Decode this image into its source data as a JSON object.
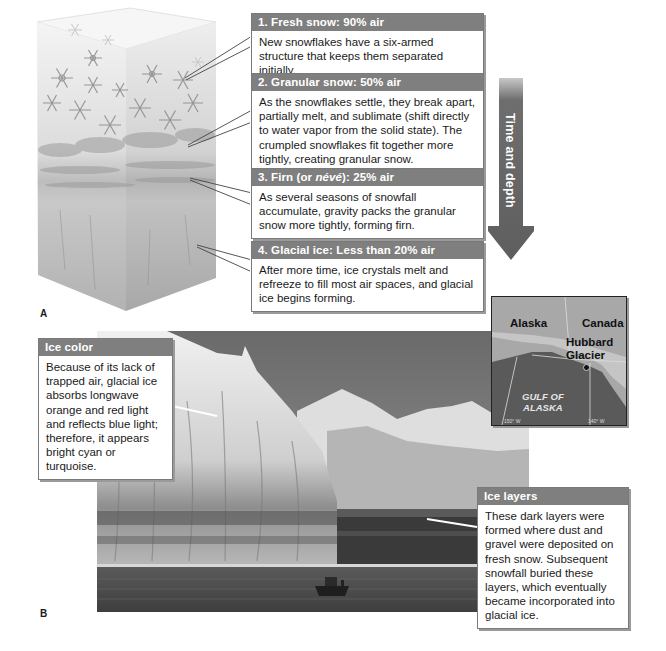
{
  "part_a": {
    "panel_label": "A",
    "stages": [
      {
        "title_prefix": "1. Fresh snow: 90% air",
        "title_italic": "",
        "title_suffix": "",
        "text": "New snowflakes have a six-armed structure that keeps them separated initially."
      },
      {
        "title_prefix": "2. Granular snow: 50% air",
        "title_italic": "",
        "title_suffix": "",
        "text": "As the snowflakes settle, they break apart, partially melt, and sublimate (shift directly to water vapor from the solid state). The crumpled snowflakes fit together more tightly, creating granular snow."
      },
      {
        "title_prefix": "3. Firn (or ",
        "title_italic": "névé",
        "title_suffix": "): 25% air",
        "text": "As several seasons of snowfall accumulate, gravity packs the granular snow more tightly, forming firn."
      },
      {
        "title_prefix": "4. Glacial ice: Less than 20% air",
        "title_italic": "",
        "title_suffix": "",
        "text": "After more time, ice crystals melt and refreeze to fill most air spaces, and glacial ice begins forming."
      }
    ],
    "arrow_label": "Time and depth"
  },
  "part_b": {
    "panel_label": "B",
    "ice_color": {
      "title": "Ice color",
      "text": "Because of its lack of trapped air, glacial ice absorbs longwave orange and red light and reflects blue light; therefore, it appears bright cyan or turquoise."
    },
    "ice_layers": {
      "title": "Ice layers",
      "text": "These dark layers were formed where dust and gravel were deposited on fresh snow. Subsequent snowfall buried these layers, which eventually became incorporated into glacial ice."
    },
    "map": {
      "labels": {
        "alaska": "Alaska",
        "canada": "Canada",
        "glacier_line1": "Hubbard",
        "glacier_line2": "Glacier",
        "gulf_line1": "GULF OF",
        "gulf_line2": "ALASKA"
      },
      "longitudes": [
        "150° W",
        "140° W"
      ]
    }
  },
  "colors": {
    "header_gray": "#7f7f7f",
    "arrow_gray": "#6e6e6e",
    "box_border": "#7a7a7a"
  }
}
